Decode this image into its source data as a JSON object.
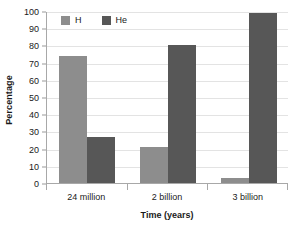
{
  "chart_data": {
    "type": "bar",
    "title": "",
    "xlabel": "Time (years)",
    "ylabel": "Percentage",
    "categories": [
      "24 million",
      "2 billion",
      "3 billion"
    ],
    "series": [
      {
        "name": "H",
        "values": [
          74,
          21,
          3
        ],
        "color": "#8d8d8d"
      },
      {
        "name": "He",
        "values": [
          27,
          80,
          99
        ],
        "color": "#575757"
      }
    ],
    "ylim": [
      0,
      100
    ],
    "ytick_step": 10,
    "yticks": [
      0,
      10,
      20,
      30,
      40,
      50,
      60,
      70,
      80,
      90,
      100
    ],
    "ytick_labels": [
      "0",
      "10",
      "20",
      "30",
      "40",
      "50",
      "60",
      "70",
      "80",
      "90",
      "100"
    ],
    "grid": true,
    "grid_axis": "y",
    "legend_position": "top-left",
    "legend_entries": [
      "H",
      "He"
    ],
    "annotations": []
  },
  "axes": {
    "y_title": "Percentage",
    "x_title": "Time (years)"
  },
  "legend": {
    "items": [
      {
        "label": "H",
        "swatch_name": "legend-swatch-h"
      },
      {
        "label": "He",
        "swatch_name": "legend-swatch-he"
      }
    ]
  },
  "colors": {
    "series_h": "#8d8d8d",
    "series_he": "#575757",
    "gridline": "#e3e3e3",
    "axis": "#a8a8a8",
    "text": "#1a1a1a",
    "background": "#ffffff"
  }
}
